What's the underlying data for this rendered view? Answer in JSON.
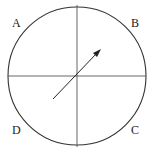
{
  "diagram": {
    "labels": {
      "a": "A",
      "b": "B",
      "c": "C",
      "d": "D"
    },
    "circle": {
      "cx": 77,
      "cy": 76,
      "r": 69
    },
    "arrow": {
      "from": [
        53,
        99
      ],
      "to": [
        100,
        50
      ]
    },
    "colors": {
      "stroke": "#333333",
      "axes": "#555555",
      "background": "#ffffff"
    }
  }
}
